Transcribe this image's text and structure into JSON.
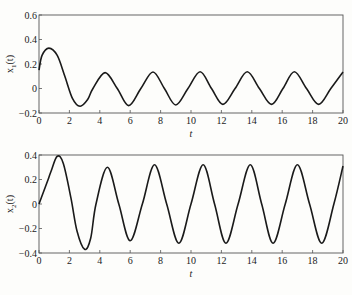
{
  "chart_data": [
    {
      "type": "line",
      "title": "",
      "xlabel": "t",
      "ylabel": "x1(t)",
      "ylabel_main": "x",
      "ylabel_sub": "1",
      "ylabel_tail": "(t)",
      "xlim": [
        0,
        20
      ],
      "ylim": [
        -0.2,
        0.6
      ],
      "grid": false,
      "xticks": [
        0,
        2,
        4,
        6,
        8,
        10,
        12,
        14,
        16,
        18,
        20
      ],
      "yticks": [
        -0.2,
        0,
        0.2,
        0.4,
        0.6
      ],
      "ytick_labels": [
        "-0.2",
        "0",
        "0.2",
        "0.4",
        "0.6"
      ],
      "series": [
        {
          "name": "x1(t)",
          "color": "#1a1a1a",
          "points": [
            [
              0,
              0.15
            ],
            [
              0.2,
              0.27
            ],
            [
              0.65,
              0.33
            ],
            [
              1.2,
              0.27
            ],
            [
              1.7,
              0.1
            ],
            [
              2.2,
              -0.08
            ],
            [
              2.7,
              -0.145
            ],
            [
              3.2,
              -0.09
            ],
            [
              3.55,
              0.0
            ],
            [
              4.35,
              0.13
            ],
            [
              5.15,
              0.0
            ],
            [
              5.9,
              -0.14
            ],
            [
              6.7,
              0.0
            ],
            [
              7.5,
              0.135
            ],
            [
              8.25,
              0.0
            ],
            [
              9.0,
              -0.135
            ],
            [
              9.8,
              0.0
            ],
            [
              10.6,
              0.137
            ],
            [
              11.35,
              0.0
            ],
            [
              12.1,
              -0.13
            ],
            [
              12.9,
              0.0
            ],
            [
              13.7,
              0.137
            ],
            [
              14.5,
              0.0
            ],
            [
              15.3,
              -0.13
            ],
            [
              16.05,
              0.0
            ],
            [
              16.8,
              0.137
            ],
            [
              17.6,
              0.0
            ],
            [
              18.4,
              -0.13
            ],
            [
              19.2,
              0.0
            ],
            [
              20,
              0.135
            ]
          ]
        }
      ]
    },
    {
      "type": "line",
      "title": "",
      "xlabel": "t",
      "ylabel": "x2(t)",
      "ylabel_main": "x",
      "ylabel_sub": "2",
      "ylabel_tail": "(t)",
      "xlim": [
        0,
        20
      ],
      "ylim": [
        -0.4,
        0.4
      ],
      "grid": false,
      "xticks": [
        0,
        2,
        4,
        6,
        8,
        10,
        12,
        14,
        16,
        18,
        20
      ],
      "yticks": [
        -0.4,
        -0.2,
        0,
        0.2,
        0.4
      ],
      "ytick_labels": [
        "-0.4",
        "-0.2",
        "0",
        "0.2",
        "0.4"
      ],
      "series": [
        {
          "name": "x2(t)",
          "color": "#1a1a1a",
          "points": [
            [
              0,
              0.0
            ],
            [
              0.3,
              0.1
            ],
            [
              0.6,
              0.2
            ],
            [
              0.8,
              0.27
            ],
            [
              1.2,
              0.39
            ],
            [
              1.6,
              0.33
            ],
            [
              2.1,
              0.05
            ],
            [
              2.5,
              -0.22
            ],
            [
              3.0,
              -0.37
            ],
            [
              3.4,
              -0.28
            ],
            [
              3.75,
              0.0
            ],
            [
              4.5,
              0.3
            ],
            [
              5.25,
              0.0
            ],
            [
              6.0,
              -0.3
            ],
            [
              6.8,
              0.0
            ],
            [
              7.6,
              0.32
            ],
            [
              8.4,
              0.0
            ],
            [
              9.2,
              -0.32
            ],
            [
              10.0,
              0.0
            ],
            [
              10.8,
              0.32
            ],
            [
              11.55,
              0.0
            ],
            [
              12.3,
              -0.32
            ],
            [
              13.1,
              0.0
            ],
            [
              13.9,
              0.32
            ],
            [
              14.65,
              0.0
            ],
            [
              15.4,
              -0.32
            ],
            [
              16.2,
              0.0
            ],
            [
              17.0,
              0.32
            ],
            [
              17.8,
              0.0
            ],
            [
              18.6,
              -0.32
            ],
            [
              19.4,
              0.0
            ],
            [
              20,
              0.31
            ]
          ]
        }
      ]
    }
  ],
  "layout": {
    "panels": [
      {
        "left": 39,
        "top": 15,
        "right": 343,
        "bottom": 113
      },
      {
        "left": 39,
        "top": 155,
        "right": 343,
        "bottom": 253
      }
    ],
    "axis_color": "#555555",
    "line_color": "#1a1a1a"
  }
}
